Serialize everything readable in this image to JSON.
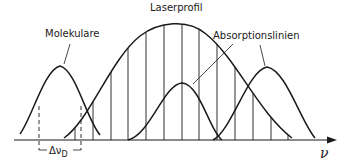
{
  "diagram": {
    "labels": {
      "laser_profile": "Laserprofil",
      "molecular": "Molekulare",
      "absorption_lines": "Absorptionslinien",
      "doppler_width": "Δν",
      "doppler_subscript": "D",
      "axis": "ν"
    },
    "colors": {
      "stroke": "#1a1a1a",
      "background": "#ffffff"
    },
    "elements": [
      {
        "type": "gaussian",
        "name": "molecular-line",
        "peak_x": 60,
        "peak_y": 66,
        "span": [
          20,
          100
        ]
      },
      {
        "type": "gaussian",
        "name": "laser-profile",
        "peak_x": 173,
        "peak_y": 22,
        "span": [
          64,
          292
        ]
      },
      {
        "type": "gaussian",
        "name": "absorption-line-center",
        "peak_x": 182,
        "peak_y": 83,
        "span": [
          128,
          237
        ]
      },
      {
        "type": "gaussian",
        "name": "absorption-line-right",
        "peak_x": 267,
        "peak_y": 67,
        "span": [
          220,
          315
        ]
      }
    ],
    "mode_lines_x": [
      75,
      93,
      111,
      128,
      146,
      164,
      182,
      199,
      217,
      235,
      253,
      271,
      288
    ]
  }
}
